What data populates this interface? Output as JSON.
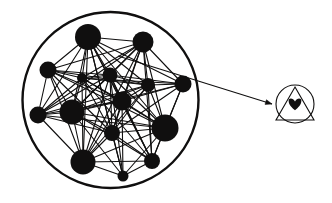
{
  "figure": {
    "background_color": "#ffffff",
    "stroke_color": "#100f0f",
    "node_color": "#100f0f",
    "width": 332,
    "height": 203
  },
  "network": {
    "label": "network-graph",
    "boundary": {
      "shape": "circle",
      "cx": 110.5,
      "cy": 100,
      "r": 88,
      "stroke_width": 2.4,
      "fill": "none"
    },
    "node_count": 15,
    "edge_style": {
      "stroke_width": 1.1,
      "color": "#100f0f"
    },
    "nodes": [
      {
        "id": "n1",
        "label": "node-1",
        "cx": 88,
        "cy": 37,
        "r": 13
      },
      {
        "id": "n2",
        "label": "node-2",
        "cx": 143,
        "cy": 42,
        "r": 10.5
      },
      {
        "id": "n3",
        "label": "node-3",
        "cx": 48,
        "cy": 70,
        "r": 8.5
      },
      {
        "id": "n4",
        "label": "node-4",
        "cx": 82,
        "cy": 78,
        "r": 5
      },
      {
        "id": "n5",
        "label": "node-5",
        "cx": 110,
        "cy": 75,
        "r": 7.5
      },
      {
        "id": "n6",
        "label": "node-6",
        "cx": 148,
        "cy": 85,
        "r": 7
      },
      {
        "id": "n7",
        "label": "node-7",
        "cx": 183,
        "cy": 84,
        "r": 8.5
      },
      {
        "id": "n8",
        "label": "node-8",
        "cx": 122,
        "cy": 101,
        "r": 9.5
      },
      {
        "id": "n9",
        "label": "node-9",
        "cx": 72,
        "cy": 112,
        "r": 12.5
      },
      {
        "id": "n10",
        "label": "node-10",
        "cx": 38,
        "cy": 115,
        "r": 8.5
      },
      {
        "id": "n11",
        "label": "node-11",
        "cx": 165,
        "cy": 128,
        "r": 13.5
      },
      {
        "id": "n12",
        "label": "node-12",
        "cx": 112,
        "cy": 133,
        "r": 8
      },
      {
        "id": "n13",
        "label": "node-13",
        "cx": 83,
        "cy": 162,
        "r": 12.5
      },
      {
        "id": "n14",
        "label": "node-14",
        "cx": 152,
        "cy": 161,
        "r": 8
      },
      {
        "id": "n15",
        "label": "node-15",
        "cx": 123,
        "cy": 176,
        "r": 5.5
      }
    ],
    "edges": [
      [
        "n1",
        "n2"
      ],
      [
        "n1",
        "n3"
      ],
      [
        "n1",
        "n4"
      ],
      [
        "n1",
        "n5"
      ],
      [
        "n1",
        "n6"
      ],
      [
        "n1",
        "n7"
      ],
      [
        "n1",
        "n8"
      ],
      [
        "n1",
        "n9"
      ],
      [
        "n1",
        "n10"
      ],
      [
        "n1",
        "n11"
      ],
      [
        "n1",
        "n12"
      ],
      [
        "n1",
        "n13"
      ],
      [
        "n1",
        "n14"
      ],
      [
        "n1",
        "n15"
      ],
      [
        "n2",
        "n3"
      ],
      [
        "n2",
        "n4"
      ],
      [
        "n2",
        "n5"
      ],
      [
        "n2",
        "n6"
      ],
      [
        "n2",
        "n7"
      ],
      [
        "n2",
        "n8"
      ],
      [
        "n2",
        "n9"
      ],
      [
        "n2",
        "n10"
      ],
      [
        "n2",
        "n11"
      ],
      [
        "n2",
        "n12"
      ],
      [
        "n2",
        "n13"
      ],
      [
        "n2",
        "n14"
      ],
      [
        "n3",
        "n4"
      ],
      [
        "n3",
        "n5"
      ],
      [
        "n3",
        "n6"
      ],
      [
        "n3",
        "n8"
      ],
      [
        "n3",
        "n9"
      ],
      [
        "n3",
        "n10"
      ],
      [
        "n3",
        "n11"
      ],
      [
        "n3",
        "n12"
      ],
      [
        "n3",
        "n13"
      ],
      [
        "n4",
        "n5"
      ],
      [
        "n4",
        "n6"
      ],
      [
        "n4",
        "n7"
      ],
      [
        "n4",
        "n8"
      ],
      [
        "n4",
        "n9"
      ],
      [
        "n4",
        "n10"
      ],
      [
        "n4",
        "n11"
      ],
      [
        "n4",
        "n12"
      ],
      [
        "n4",
        "n13"
      ],
      [
        "n4",
        "n14"
      ],
      [
        "n5",
        "n6"
      ],
      [
        "n5",
        "n7"
      ],
      [
        "n5",
        "n8"
      ],
      [
        "n5",
        "n9"
      ],
      [
        "n5",
        "n10"
      ],
      [
        "n5",
        "n11"
      ],
      [
        "n5",
        "n12"
      ],
      [
        "n5",
        "n13"
      ],
      [
        "n5",
        "n14"
      ],
      [
        "n5",
        "n15"
      ],
      [
        "n6",
        "n7"
      ],
      [
        "n6",
        "n8"
      ],
      [
        "n6",
        "n9"
      ],
      [
        "n6",
        "n10"
      ],
      [
        "n6",
        "n11"
      ],
      [
        "n6",
        "n12"
      ],
      [
        "n6",
        "n13"
      ],
      [
        "n6",
        "n14"
      ],
      [
        "n7",
        "n8"
      ],
      [
        "n7",
        "n9"
      ],
      [
        "n7",
        "n11"
      ],
      [
        "n7",
        "n12"
      ],
      [
        "n7",
        "n14"
      ],
      [
        "n8",
        "n9"
      ],
      [
        "n8",
        "n10"
      ],
      [
        "n8",
        "n11"
      ],
      [
        "n8",
        "n12"
      ],
      [
        "n8",
        "n13"
      ],
      [
        "n8",
        "n14"
      ],
      [
        "n8",
        "n15"
      ],
      [
        "n9",
        "n10"
      ],
      [
        "n9",
        "n11"
      ],
      [
        "n9",
        "n12"
      ],
      [
        "n9",
        "n13"
      ],
      [
        "n9",
        "n14"
      ],
      [
        "n9",
        "n15"
      ],
      [
        "n10",
        "n11"
      ],
      [
        "n10",
        "n12"
      ],
      [
        "n10",
        "n13"
      ],
      [
        "n11",
        "n12"
      ],
      [
        "n11",
        "n13"
      ],
      [
        "n11",
        "n14"
      ],
      [
        "n11",
        "n15"
      ],
      [
        "n12",
        "n13"
      ],
      [
        "n12",
        "n14"
      ],
      [
        "n12",
        "n15"
      ],
      [
        "n13",
        "n14"
      ],
      [
        "n13",
        "n15"
      ],
      [
        "n14",
        "n15"
      ]
    ]
  },
  "callout": {
    "label": "magnification-arrow",
    "x1": 118,
    "y1": 56,
    "x2": 272,
    "y2": 104,
    "stroke_width": 1.1,
    "arrowhead": {
      "tip_x": 272,
      "tip_y": 104,
      "size": 7
    }
  },
  "inset": {
    "label": "magnified-node-symbol",
    "circle": {
      "cx": 295,
      "cy": 104,
      "r": 19,
      "stroke_width": 1.1
    },
    "triangle": {
      "apex_x": 295,
      "apex_y": 87,
      "left_x": 276,
      "left_y": 120,
      "right_x": 314,
      "right_y": 120,
      "stroke_width": 1.1
    },
    "heart": {
      "name": "heart-icon",
      "cx": 295,
      "cy": 104,
      "size": 11,
      "fill": "#100f0f"
    }
  }
}
